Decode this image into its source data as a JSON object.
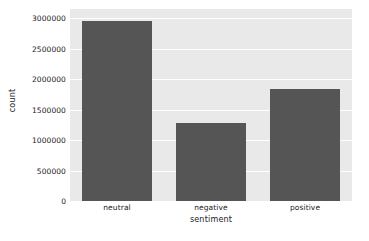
{
  "chart_data": {
    "type": "bar",
    "title": "",
    "categories": [
      "neutral",
      "negative",
      "positive"
    ],
    "values": [
      2950000,
      1280000,
      1830000
    ],
    "xlabel": "sentiment",
    "ylabel": "count",
    "ylim": [
      0,
      3150000
    ],
    "yticks": [
      0,
      500000,
      1000000,
      1500000,
      2000000,
      2500000,
      3000000
    ],
    "ytick_labels": [
      "0",
      "500000",
      "1000000",
      "1500000",
      "2000000",
      "2500000",
      "3000000"
    ],
    "grid": true,
    "grid_axis": "y",
    "legend": false,
    "legend_position": "none",
    "colors": {
      "bar": "#555555",
      "plot_background": "#e9e9e9",
      "gridline": "#ffffff",
      "figure_background": "#ffffff",
      "text": "#1a1a1a"
    }
  }
}
